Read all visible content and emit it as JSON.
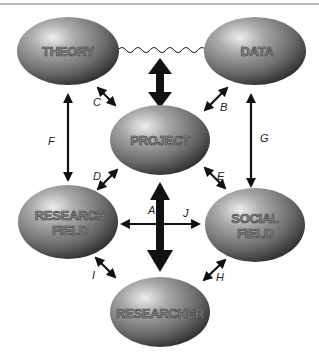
{
  "diagram": {
    "type": "concept-relationship",
    "colors": {
      "node_highlight": "#e8e8e8",
      "node_mid": "#8c8c8c",
      "node_dark": "#2e2e2e",
      "arrow": "#111111",
      "border_line": "#777777",
      "background": "#ffffff"
    },
    "nodes": [
      {
        "id": "theory",
        "label_lines": [
          "THEORY"
        ]
      },
      {
        "id": "data",
        "label_lines": [
          "DATA"
        ]
      },
      {
        "id": "project",
        "label_lines": [
          "PROJECT"
        ]
      },
      {
        "id": "research_field",
        "label_lines": [
          "RESEARCH",
          "FIELD"
        ]
      },
      {
        "id": "social_field",
        "label_lines": [
          "SOCIAL",
          "FIELD"
        ]
      },
      {
        "id": "researcher",
        "label_lines": [
          "RESEARCHER"
        ]
      }
    ],
    "edges": [
      {
        "label": "A",
        "from": "project",
        "to": "researcher",
        "style": "thick-double-arrow"
      },
      {
        "label": "B",
        "from": "data",
        "to": "project",
        "style": "double-arrow"
      },
      {
        "label": "C",
        "from": "theory",
        "to": "project",
        "style": "double-arrow"
      },
      {
        "label": "D",
        "from": "project",
        "to": "research_field",
        "style": "double-arrow"
      },
      {
        "label": "E",
        "from": "project",
        "to": "social_field",
        "style": "double-arrow"
      },
      {
        "label": "F",
        "from": "theory",
        "to": "research_field",
        "style": "double-arrow"
      },
      {
        "label": "G",
        "from": "data",
        "to": "social_field",
        "style": "double-arrow"
      },
      {
        "label": "H",
        "from": "social_field",
        "to": "researcher",
        "style": "double-arrow"
      },
      {
        "label": "I",
        "from": "research_field",
        "to": "researcher",
        "style": "double-arrow"
      },
      {
        "label": "J",
        "from": "research_field",
        "to": "social_field",
        "style": "double-arrow"
      },
      {
        "label": "",
        "from": "theory",
        "to": "data",
        "style": "wavy-line"
      },
      {
        "label": "",
        "from": "theory-data-link",
        "to": "project",
        "style": "thick-double-arrow"
      }
    ]
  }
}
